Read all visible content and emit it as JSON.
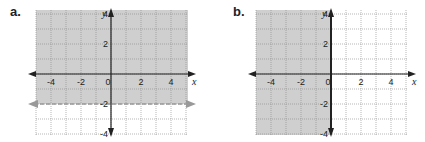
{
  "panels": [
    {
      "label": "a."
    },
    {
      "label": "b."
    }
  ],
  "chart_data": [
    {
      "type": "inequality-graph",
      "title": "a.",
      "xlabel": "x",
      "ylabel": "y",
      "xlim": [
        -5,
        5
      ],
      "ylim": [
        -5,
        5
      ],
      "xticks": [
        "-4",
        "-2",
        "0",
        "2",
        "4"
      ],
      "yticks": [
        "4",
        "2",
        "-2",
        "-4"
      ],
      "grid": true,
      "boundary": {
        "equation": "y = -2",
        "style": "dashed",
        "color": "#999999"
      },
      "shaded_region": "y > -2",
      "shade_color": "#cfcfcf"
    },
    {
      "type": "inequality-graph",
      "title": "b.",
      "xlabel": "x",
      "ylabel": "y",
      "xlim": [
        -5,
        5
      ],
      "ylim": [
        -5,
        5
      ],
      "xticks": [
        "-4",
        "-2",
        "0",
        "2",
        "4"
      ],
      "yticks": [
        "4",
        "2",
        "-2",
        "-4"
      ],
      "grid": true,
      "boundary": {
        "equation": "x = 0",
        "style": "solid",
        "color": "#333333"
      },
      "shaded_region": "x ≤ 0",
      "shade_color": "#cfcfcf"
    }
  ]
}
